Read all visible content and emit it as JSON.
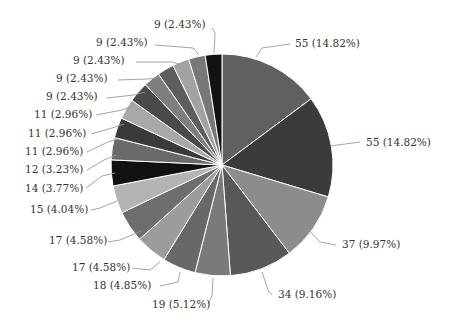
{
  "chart_data": {
    "type": "pie",
    "title": "",
    "start_angle_deg": 0,
    "direction": "clockwise",
    "total": 371,
    "slices": [
      {
        "value": 55,
        "percent": "14.82%",
        "label": "55 (14.82%)",
        "color": "#606060"
      },
      {
        "value": 55,
        "percent": "14.82%",
        "label": "55 (14.82%)",
        "color": "#3b3b3b"
      },
      {
        "value": 37,
        "percent": "9.97%",
        "label": "37 (9.97%)",
        "color": "#8c8c8c"
      },
      {
        "value": 34,
        "percent": "9.16%",
        "label": "34 (9.16%)",
        "color": "#585858"
      },
      {
        "value": 19,
        "percent": "5.12%",
        "label": "19 (5.12%)",
        "color": "#7a7a7a"
      },
      {
        "value": 18,
        "percent": "4.85%",
        "label": "18 (4.85%)",
        "color": "#686868"
      },
      {
        "value": 17,
        "percent": "4.58%",
        "label": "17 (4.58%)",
        "color": "#9c9c9c"
      },
      {
        "value": 17,
        "percent": "4.58%",
        "label": "17 (4.58%)",
        "color": "#6e6e6e"
      },
      {
        "value": 15,
        "percent": "4.04%",
        "label": "15 (4.04%)",
        "color": "#b4b4b4"
      },
      {
        "value": 14,
        "percent": "3.77%",
        "label": "14 (3.77%)",
        "color": "#111111"
      },
      {
        "value": 12,
        "percent": "3.23%",
        "label": "12 (3.23%)",
        "color": "#6a6a6a"
      },
      {
        "value": 11,
        "percent": "2.96%",
        "label": "11 (2.96%)",
        "color": "#3a3a3a"
      },
      {
        "value": 11,
        "percent": "2.96%",
        "label": "11 (2.96%)",
        "color": "#a8a8a8"
      },
      {
        "value": 11,
        "percent": "2.96%",
        "label": "11 (2.96%)",
        "color": "#4a4a4a"
      },
      {
        "value": 9,
        "percent": "2.43%",
        "label": "9 (2.43%)",
        "color": "#7e7e7e"
      },
      {
        "value": 9,
        "percent": "2.43%",
        "label": "9 (2.43%)",
        "color": "#5e5e5e"
      },
      {
        "value": 9,
        "percent": "2.43%",
        "label": "9 (2.43%)",
        "color": "#a2a2a2"
      },
      {
        "value": 9,
        "percent": "2.43%",
        "label": "9 (2.43%)",
        "color": "#787878"
      },
      {
        "value": 9,
        "percent": "2.43%",
        "label": "9 (2.43%)",
        "color": "#121212"
      }
    ],
    "legend": "none",
    "label_style": "value (percent) with leader lines"
  },
  "layout": {
    "center": [
      222,
      165
    ],
    "radius": 111,
    "labels": [
      {
        "x": 295,
        "y": 47,
        "anchor": "start",
        "line": [
          [
            256,
            57
          ],
          [
            262,
            48
          ],
          [
            290,
            44
          ]
        ]
      },
      {
        "x": 366,
        "y": 146,
        "anchor": "start",
        "line": [
          [
            330,
            146
          ],
          [
            360,
            142
          ]
        ]
      },
      {
        "x": 342,
        "y": 248,
        "anchor": "start",
        "line": [
          [
            308,
            229
          ],
          [
            320,
            242
          ],
          [
            336,
            245
          ]
        ]
      },
      {
        "x": 278,
        "y": 298,
        "anchor": "start",
        "line": [
          [
            262,
            272
          ],
          [
            268,
            290
          ],
          [
            272,
            295
          ]
        ]
      },
      {
        "x": 152,
        "y": 308,
        "anchor": "start",
        "line": [
          [
            213,
            278
          ],
          [
            212,
            296
          ],
          [
            208,
            304
          ]
        ]
      },
      {
        "x": 93,
        "y": 289,
        "anchor": "start",
        "line": [
          [
            180,
            272
          ],
          [
            178,
            282
          ],
          [
            160,
            286
          ]
        ]
      },
      {
        "x": 72,
        "y": 271,
        "anchor": "start",
        "line": [
          [
            160,
            262
          ],
          [
            150,
            270
          ],
          [
            132,
            268
          ]
        ]
      },
      {
        "x": 49,
        "y": 244,
        "anchor": "start",
        "line": [
          [
            141,
            231
          ],
          [
            120,
            240
          ],
          [
            108,
            242
          ]
        ]
      },
      {
        "x": 30,
        "y": 213,
        "anchor": "start",
        "line": [
          [
            117,
            201
          ],
          [
            100,
            208
          ],
          [
            91,
            210
          ]
        ]
      },
      {
        "x": 25,
        "y": 192,
        "anchor": "start",
        "line": [
          [
            115,
            173
          ],
          [
            102,
            176
          ],
          [
            86,
            188
          ]
        ]
      },
      {
        "x": 25,
        "y": 173,
        "anchor": "start",
        "line": [
          [
            116,
            155
          ],
          [
            104,
            160
          ],
          [
            87,
            170
          ]
        ]
      },
      {
        "x": 25,
        "y": 155,
        "anchor": "start",
        "line": [
          [
            118,
            139
          ],
          [
            108,
            142
          ],
          [
            87,
            152
          ]
        ]
      },
      {
        "x": 28,
        "y": 137,
        "anchor": "start",
        "line": [
          [
            124,
            124
          ],
          [
            112,
            128
          ],
          [
            91,
            134
          ]
        ]
      },
      {
        "x": 34,
        "y": 118,
        "anchor": "start",
        "line": [
          [
            133,
            106
          ],
          [
            122,
            110
          ],
          [
            96,
            115
          ]
        ]
      },
      {
        "x": 46,
        "y": 100,
        "anchor": "start",
        "line": [
          [
            145,
            92
          ],
          [
            134,
            95
          ],
          [
            107,
            98
          ]
        ]
      },
      {
        "x": 56,
        "y": 82,
        "anchor": "start",
        "line": [
          [
            160,
            77
          ],
          [
            148,
            79
          ],
          [
            118,
            80
          ]
        ]
      },
      {
        "x": 73,
        "y": 64,
        "anchor": "start",
        "line": [
          [
            179,
            64
          ],
          [
            172,
            62
          ],
          [
            136,
            62
          ]
        ]
      },
      {
        "x": 96,
        "y": 46,
        "anchor": "start",
        "line": [
          [
            199,
            55
          ],
          [
            193,
            48
          ],
          [
            155,
            45
          ]
        ]
      },
      {
        "x": 154,
        "y": 28,
        "anchor": "start",
        "line": [
          [
            214,
            53
          ],
          [
            215,
            33
          ],
          [
            212,
            28
          ]
        ]
      }
    ]
  }
}
